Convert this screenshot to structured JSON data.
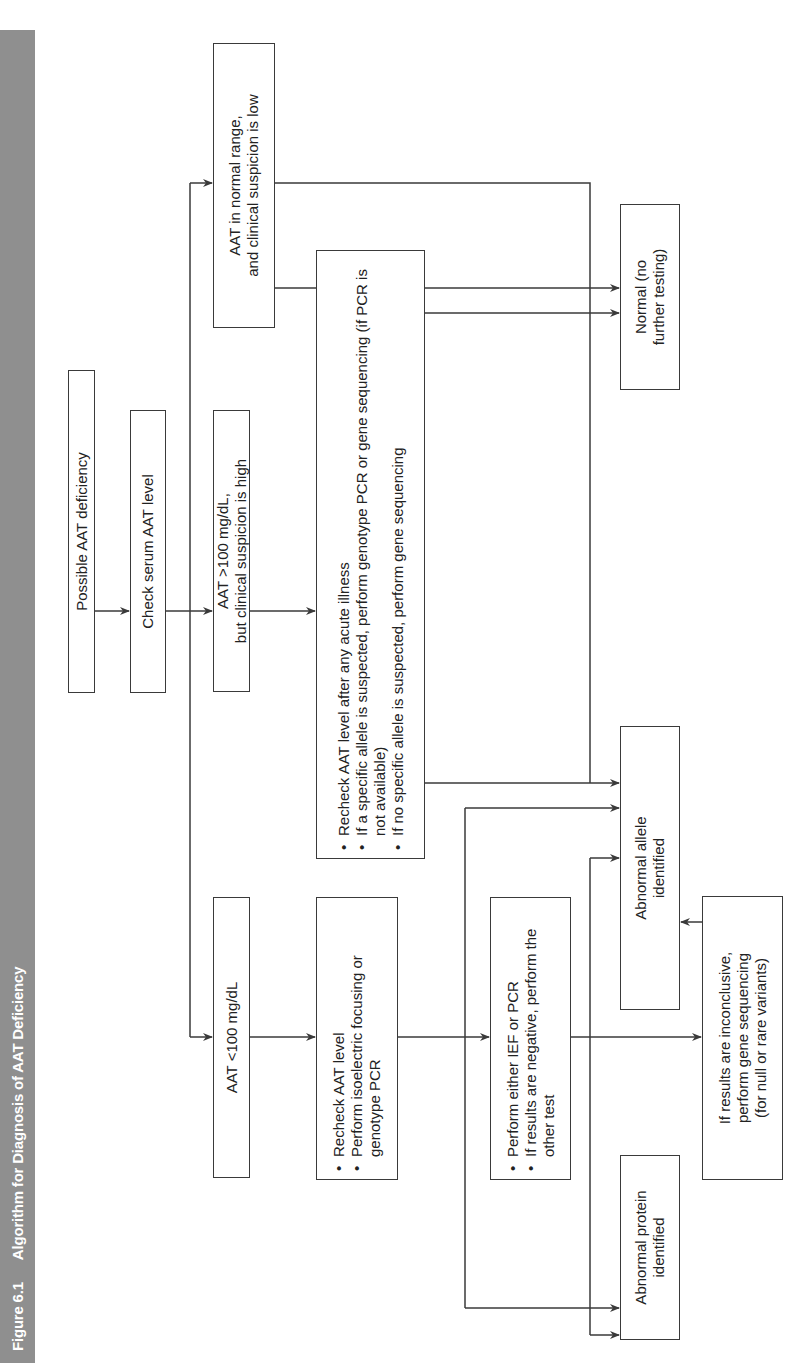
{
  "figure": {
    "number": "Figure 6.1",
    "title": "Algorithm for Diagnosis of AAT Deficiency"
  },
  "nodes": {
    "start": {
      "text": "Possible AAT deficiency"
    },
    "check": {
      "text": "Check serum AAT level"
    },
    "low": {
      "text": "AAT <100 mg/dL"
    },
    "high": {
      "line1": "AAT >100 mg/dL,",
      "line2": "but clinical suspicion is high"
    },
    "normal_range": {
      "line1": "AAT in normal range,",
      "line2": "and clinical suspicion is low"
    },
    "recheck_high": {
      "items": [
        "Recheck AAT level after any acute illness",
        "If a specific allele is suspected, perform genotype PCR or gene sequencing (if PCR is not available)",
        "If no specific allele is suspected, perform gene sequencing"
      ]
    },
    "recheck_low": {
      "items": [
        "Recheck AAT level",
        "Perform isoelectric focusing or genotype PCR"
      ]
    },
    "ief_pcr": {
      "items": [
        "Perform either IEF or PCR",
        "If results are negative, perform the other test"
      ]
    },
    "abnormal_allele": {
      "line1": "Abnormal allele",
      "line2": "identified"
    },
    "normal_result": {
      "line1": "Normal (no",
      "line2": "further testing)"
    },
    "abnormal_protein": {
      "line1": "Abnormal protein",
      "line2": "identified"
    },
    "inconclusive": {
      "line1": "If results are inconclusive,",
      "line2": "perform gene sequencing",
      "line3": "(for null or rare variants)"
    }
  },
  "colors": {
    "title_bar": "#8f8f8f",
    "title_text": "#ffffff",
    "line": "#3a3a3a"
  }
}
